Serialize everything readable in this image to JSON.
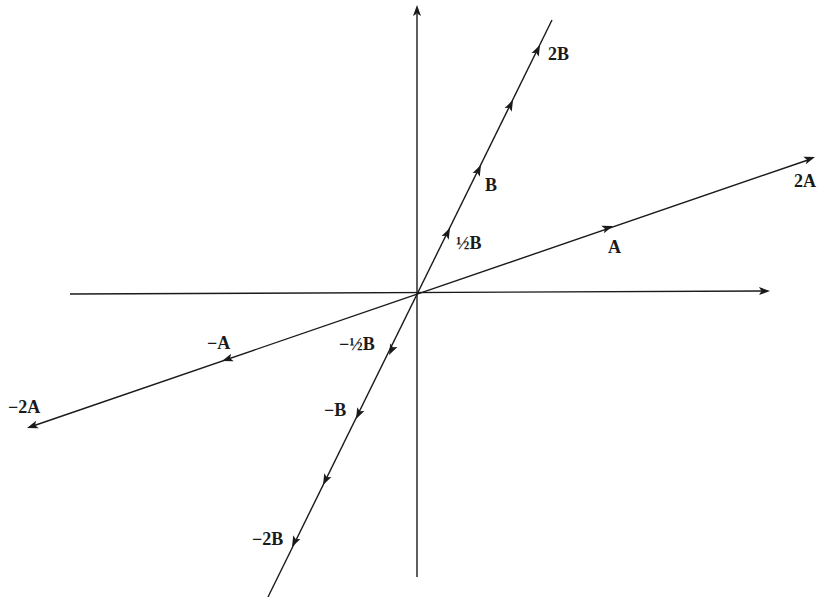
{
  "diagram": {
    "colors": {
      "ink": "#1a1a1a",
      "background": "#ffffff"
    },
    "origin": [
      418,
      293
    ],
    "axes": {
      "x": {
        "from": [
          70,
          294
        ],
        "to": [
          770,
          290
        ]
      },
      "y": {
        "from": [
          417,
          577
        ],
        "to": [
          417,
          5
        ]
      }
    },
    "lines": {
      "A": {
        "from": [
          27,
          428
        ],
        "to": [
          815,
          157
        ]
      },
      "B": {
        "from": [
          268,
          597
        ],
        "to": [
          552,
          20
        ]
      }
    },
    "labels": {
      "A": "A",
      "two_A": "2A",
      "neg_A": "−A",
      "neg_two_A": "−2A",
      "half_B": "½B",
      "B": "B",
      "two_B": "2B",
      "neg_half_B": "−½B",
      "neg_B": "−B",
      "neg_two_B": "−2B"
    },
    "arrows": [
      {
        "name": "A",
        "at": [
          607,
          228
        ],
        "dir": "up-right"
      },
      {
        "name": "2A",
        "at": [
          815,
          157
        ],
        "dir": "up-right"
      },
      {
        "name": "-A",
        "at": [
          228,
          359
        ],
        "dir": "down-left"
      },
      {
        "name": "-2A",
        "at": [
          27,
          428
        ],
        "dir": "down-left"
      },
      {
        "name": "1/2B",
        "at": [
          447,
          233
        ],
        "dir": "up"
      },
      {
        "name": "B",
        "at": [
          478,
          170
        ],
        "dir": "up"
      },
      {
        "name": "3/2B",
        "at": [
          510,
          105
        ],
        "dir": "up"
      },
      {
        "name": "2B",
        "at": [
          537,
          50
        ],
        "dir": "up"
      },
      {
        "name": "-1/2B",
        "at": [
          391,
          350
        ],
        "dir": "down"
      },
      {
        "name": "-B",
        "at": [
          358,
          414
        ],
        "dir": "down"
      },
      {
        "name": "-3/2B",
        "at": [
          325,
          480
        ],
        "dir": "down"
      },
      {
        "name": "-2B",
        "at": [
          294,
          542
        ],
        "dir": "down"
      }
    ]
  }
}
